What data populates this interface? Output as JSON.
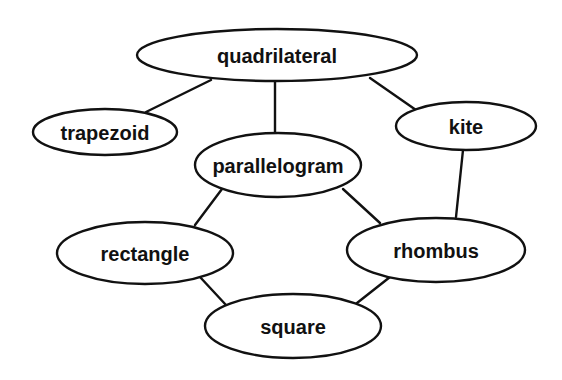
{
  "diagram": {
    "type": "hierarchy",
    "title": "",
    "colors": {
      "stroke": "#111111",
      "fill": "#ffffff",
      "text": "#111111",
      "background": "#ffffff"
    },
    "nodes": [
      {
        "id": "quadrilateral",
        "label": "quadrilateral",
        "cx": 277,
        "cy": 55,
        "rx": 140,
        "ry": 26
      },
      {
        "id": "trapezoid",
        "label": "trapezoid",
        "cx": 105,
        "cy": 132,
        "rx": 72,
        "ry": 23
      },
      {
        "id": "kite",
        "label": "kite",
        "cx": 466,
        "cy": 126,
        "rx": 70,
        "ry": 24
      },
      {
        "id": "parallelogram",
        "label": "parallelogram",
        "cx": 278,
        "cy": 165,
        "rx": 83,
        "ry": 32
      },
      {
        "id": "rectangle",
        "label": "rectangle",
        "cx": 145,
        "cy": 253,
        "rx": 88,
        "ry": 31
      },
      {
        "id": "rhombus",
        "label": "rhombus",
        "cx": 436,
        "cy": 250,
        "rx": 89,
        "ry": 32
      },
      {
        "id": "square",
        "label": "square",
        "cx": 293,
        "cy": 326,
        "rx": 88,
        "ry": 32
      }
    ],
    "edges": [
      {
        "from": "quadrilateral",
        "to": "trapezoid",
        "x1": 211,
        "y1": 80,
        "x2": 146,
        "y2": 112
      },
      {
        "from": "quadrilateral",
        "to": "parallelogram",
        "x1": 275,
        "y1": 81,
        "x2": 275,
        "y2": 133
      },
      {
        "from": "quadrilateral",
        "to": "kite",
        "x1": 370,
        "y1": 78,
        "x2": 416,
        "y2": 110
      },
      {
        "from": "parallelogram",
        "to": "rectangle",
        "x1": 222,
        "y1": 189,
        "x2": 195,
        "y2": 225
      },
      {
        "from": "parallelogram",
        "to": "rhombus",
        "x1": 343,
        "y1": 189,
        "x2": 380,
        "y2": 223
      },
      {
        "from": "kite",
        "to": "rhombus",
        "x1": 463,
        "y1": 150,
        "x2": 456,
        "y2": 217
      },
      {
        "from": "rectangle",
        "to": "square",
        "x1": 200,
        "y1": 277,
        "x2": 226,
        "y2": 305
      },
      {
        "from": "rhombus",
        "to": "square",
        "x1": 390,
        "y1": 277,
        "x2": 357,
        "y2": 303
      }
    ]
  }
}
